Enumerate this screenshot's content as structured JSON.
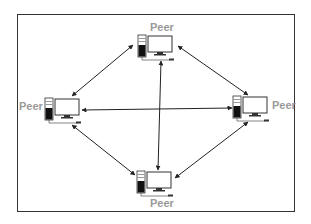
{
  "diagram": {
    "type": "peer-to-peer network",
    "nodes": [
      {
        "id": "top",
        "label": "Peer",
        "icon": "desktop-computer-icon"
      },
      {
        "id": "left",
        "label": "Peer",
        "icon": "desktop-computer-icon"
      },
      {
        "id": "right",
        "label": "Peer",
        "icon": "desktop-computer-icon"
      },
      {
        "id": "bottom",
        "label": "Peer",
        "icon": "desktop-computer-icon"
      }
    ],
    "edges": [
      {
        "from": "top",
        "to": "left",
        "direction": "bidirectional"
      },
      {
        "from": "top",
        "to": "right",
        "direction": "bidirectional"
      },
      {
        "from": "top",
        "to": "bottom",
        "direction": "bidirectional"
      },
      {
        "from": "left",
        "to": "right",
        "direction": "bidirectional"
      },
      {
        "from": "left",
        "to": "bottom",
        "direction": "bidirectional"
      },
      {
        "from": "right",
        "to": "bottom",
        "direction": "bidirectional"
      }
    ],
    "colors": {
      "border": "#333333",
      "label": "#9a9a9a",
      "line": "#222222"
    }
  }
}
